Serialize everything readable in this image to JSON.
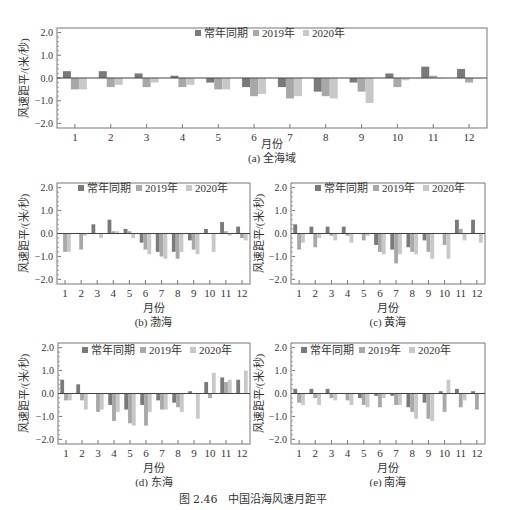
{
  "figure_caption": "图 2.46　中国沿海风速月距平",
  "legend": [
    "常年同期",
    "2019年",
    "2020年"
  ],
  "colors": {
    "常年同期": "#7a7a7a",
    "2019年": "#a8a8a8",
    "2020年": "#c8c8c8",
    "axis": "#555555"
  },
  "chart_data": [
    {
      "type": "bar",
      "id": "a",
      "title": "(a) 全海域",
      "xlabel": "月份",
      "ylabel": "风速距平/(米/秒)",
      "yticks": [
        "2.0",
        "1.0",
        "0.0",
        "−1.0",
        "−2.0"
      ],
      "ylim": [
        -2.2,
        2.2
      ],
      "categories": [
        "1",
        "2",
        "3",
        "4",
        "5",
        "6",
        "7",
        "8",
        "9",
        "10",
        "11",
        "12"
      ],
      "legend_position": "top-center",
      "series": [
        {
          "name": "常年同期",
          "values": [
            0.3,
            0.3,
            0.2,
            0.1,
            -0.2,
            -0.4,
            -0.4,
            -0.6,
            -0.2,
            0.2,
            0.5,
            0.4
          ]
        },
        {
          "name": "2019年",
          "values": [
            -0.5,
            -0.4,
            -0.4,
            -0.4,
            -0.5,
            -0.8,
            -0.9,
            -0.8,
            -0.6,
            -0.4,
            0.1,
            -0.2
          ]
        },
        {
          "name": "2020年",
          "values": [
            -0.5,
            -0.3,
            -0.2,
            -0.3,
            -0.5,
            -0.7,
            -0.8,
            -0.9,
            -1.1,
            -0.1,
            0.0,
            0.0
          ]
        }
      ]
    },
    {
      "type": "bar",
      "id": "b",
      "title": "(b) 渤海",
      "xlabel": "月份",
      "ylabel": "风速距平/(米/秒)",
      "yticks": [
        "2.0",
        "1.0",
        "0.0",
        "−1.0",
        "−2.0"
      ],
      "ylim": [
        -2.2,
        2.2
      ],
      "categories": [
        "1",
        "2",
        "3",
        "4",
        "5",
        "6",
        "7",
        "8",
        "9",
        "10",
        "11",
        "12"
      ],
      "legend_position": "top-center",
      "series": [
        {
          "name": "常年同期",
          "values": [
            0.0,
            0.0,
            0.4,
            0.6,
            0.2,
            -0.4,
            -0.8,
            -0.8,
            -0.3,
            0.2,
            0.5,
            0.3
          ]
        },
        {
          "name": "2019年",
          "values": [
            -0.8,
            -0.7,
            0.0,
            0.1,
            0.1,
            -0.7,
            -1.0,
            -1.1,
            -0.7,
            0.0,
            0.1,
            -0.2
          ]
        },
        {
          "name": "2020年",
          "values": [
            -0.8,
            -0.1,
            -0.2,
            0.1,
            -0.2,
            -0.9,
            -1.1,
            -0.8,
            -0.9,
            -0.8,
            -0.1,
            -0.3
          ]
        }
      ]
    },
    {
      "type": "bar",
      "id": "c",
      "title": "(c) 黄海",
      "xlabel": "月份",
      "ylabel": "风速距平/(米/秒)",
      "yticks": [
        "2.0",
        "1.0",
        "0.0",
        "−1.0",
        "−2.0"
      ],
      "ylim": [
        -2.2,
        2.2
      ],
      "categories": [
        "1",
        "2",
        "3",
        "4",
        "5",
        "6",
        "7",
        "8",
        "9",
        "10",
        "11",
        "12"
      ],
      "legend_position": "top-center",
      "series": [
        {
          "name": "常年同期",
          "values": [
            0.4,
            0.3,
            0.3,
            0.3,
            0.0,
            -0.5,
            -0.7,
            -0.6,
            -0.3,
            0.0,
            0.6,
            0.6
          ]
        },
        {
          "name": "2019年",
          "values": [
            -0.7,
            -0.6,
            -0.1,
            -0.1,
            -0.3,
            -0.8,
            -1.3,
            -0.8,
            -0.8,
            -0.5,
            0.2,
            0.0
          ]
        },
        {
          "name": "2020年",
          "values": [
            -0.4,
            -0.2,
            -0.3,
            -0.4,
            -0.1,
            -0.9,
            -0.9,
            -0.9,
            -1.1,
            -1.1,
            -0.3,
            -0.4
          ]
        }
      ]
    },
    {
      "type": "bar",
      "id": "d",
      "title": "(d) 东海",
      "xlabel": "月份",
      "ylabel": "风速距平/(米/秒)",
      "yticks": [
        "2.0",
        "1.0",
        "0.0",
        "−1.0",
        "−2.0"
      ],
      "ylim": [
        -2.2,
        2.2
      ],
      "categories": [
        "1",
        "2",
        "3",
        "4",
        "5",
        "6",
        "7",
        "8",
        "9",
        "10",
        "11",
        "12"
      ],
      "legend_position": "top-center",
      "series": [
        {
          "name": "常年同期",
          "values": [
            0.6,
            0.4,
            0.0,
            -0.5,
            -0.7,
            -0.5,
            -0.3,
            -0.4,
            0.1,
            0.5,
            0.7,
            0.6
          ]
        },
        {
          "name": "2019年",
          "values": [
            -0.3,
            -0.3,
            -0.8,
            -1.2,
            -1.3,
            -1.4,
            -0.7,
            -0.6,
            0.0,
            -0.2,
            0.5,
            0.0
          ]
        },
        {
          "name": "2020年",
          "values": [
            -0.3,
            -0.7,
            -0.7,
            -0.8,
            -1.4,
            -0.8,
            -0.7,
            -0.8,
            -1.1,
            0.9,
            0.6,
            1.0
          ]
        }
      ]
    },
    {
      "type": "bar",
      "id": "e",
      "title": "(e) 南海",
      "xlabel": "月份",
      "ylabel": "风速距平/(米/秒)",
      "yticks": [
        "2.0",
        "1.0",
        "0.0",
        "−1.0",
        "−2.0"
      ],
      "ylim": [
        -2.2,
        2.2
      ],
      "categories": [
        "1",
        "2",
        "3",
        "4",
        "5",
        "6",
        "7",
        "8",
        "9",
        "10",
        "11",
        "12"
      ],
      "legend_position": "top-center",
      "series": [
        {
          "name": "常年同期",
          "values": [
            0.2,
            0.2,
            0.2,
            0.0,
            -0.2,
            -0.1,
            -0.1,
            -0.6,
            -0.4,
            0.1,
            0.2,
            0.1
          ]
        },
        {
          "name": "2019年",
          "values": [
            -0.4,
            -0.2,
            -0.2,
            -0.3,
            -0.5,
            -0.6,
            -0.5,
            -0.8,
            -1.1,
            -0.8,
            -0.6,
            -0.7
          ]
        },
        {
          "name": "2020年",
          "values": [
            -0.5,
            -0.5,
            -0.3,
            -0.5,
            -0.6,
            -0.2,
            -0.5,
            -1.1,
            -1.2,
            0.6,
            -0.3,
            0.0
          ]
        }
      ]
    }
  ]
}
